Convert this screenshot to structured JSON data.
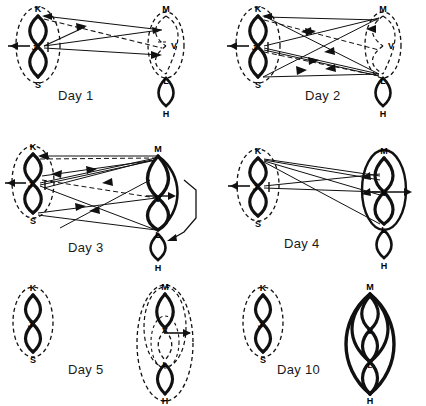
{
  "figure": {
    "type": "multi-panel network diagram",
    "panel_count": 6,
    "background": "#ffffff",
    "ink_color": "#111111"
  },
  "node_labels": {
    "K": "K",
    "J": "J",
    "S": "S",
    "M": "M",
    "V": "V",
    "L": "L",
    "H": "H"
  },
  "panels": [
    {
      "id": "day1",
      "label": "Day 1",
      "left_cluster": {
        "nodes": [
          "K",
          "J",
          "S"
        ],
        "outline": "dashed",
        "internal_links": "solid-bold"
      },
      "right_cluster": {
        "nodes": [
          "M",
          "V",
          "L"
        ],
        "outline": "dashed",
        "internal_links": "dashed"
      },
      "extra_group": {
        "nodes": [
          "L",
          "H"
        ],
        "outline": "none",
        "internal_links": "solid"
      },
      "input_arrow": true,
      "output_arrow": false,
      "inter_cluster_edges": 4,
      "dashed_edges": 1
    },
    {
      "id": "day2",
      "label": "Day 2",
      "left_cluster": {
        "nodes": [
          "K",
          "J",
          "S"
        ],
        "outline": "dashed",
        "internal_links": "solid-bold"
      },
      "right_cluster": {
        "nodes": [
          "M",
          "V",
          "L"
        ],
        "outline": "dashed",
        "internal_links": "dashed"
      },
      "extra_group": {
        "nodes": [
          "L",
          "H"
        ],
        "outline": "none",
        "internal_links": "solid"
      },
      "input_arrow": true,
      "output_arrow": false,
      "inter_cluster_edges": 9,
      "dashed_edges": 2
    },
    {
      "id": "day3",
      "label": "Day 3",
      "left_cluster": {
        "nodes": [
          "K",
          "J",
          "S"
        ],
        "outline": "dashed",
        "internal_links": "solid-bold"
      },
      "right_cluster": {
        "nodes": [
          "M",
          "V",
          "L"
        ],
        "outline": "none",
        "internal_links": "solid-bold"
      },
      "extra_group": {
        "nodes": [
          "L",
          "H"
        ],
        "outline": "none",
        "internal_links": "solid"
      },
      "bracket_M_to_H": true,
      "input_arrow": true,
      "output_arrow": true,
      "inter_cluster_edges": 10,
      "dashed_edges": 2
    },
    {
      "id": "day4",
      "label": "Day 4",
      "left_cluster": {
        "nodes": [
          "K",
          "J",
          "S"
        ],
        "outline": "dashed",
        "internal_links": "solid-bold"
      },
      "right_cluster": {
        "nodes": [
          "M",
          "V",
          "L"
        ],
        "outline": "solid-bold",
        "internal_links": "solid-bold"
      },
      "extra_group": {
        "nodes": [
          "L",
          "H"
        ],
        "outline": "none",
        "internal_links": "solid"
      },
      "input_arrow": true,
      "output_arrow": true,
      "inter_cluster_edges": 6,
      "dashed_edges": 0
    },
    {
      "id": "day5",
      "label": "Day 5",
      "left_cluster": {
        "nodes": [
          "K",
          "J",
          "S"
        ],
        "outline": "dashed",
        "internal_links": "solid-bold"
      },
      "right_cluster": {
        "nodes": [
          "M",
          "V",
          "L",
          "H"
        ],
        "outline": "dashed-nested",
        "internal_links": "mixed"
      },
      "input_arrow": false,
      "output_arrow": true,
      "inter_cluster_edges": 0,
      "dashed_edges": 0
    },
    {
      "id": "day10",
      "label": "Day 10",
      "left_cluster": {
        "nodes": [
          "K",
          "J",
          "S"
        ],
        "outline": "dashed",
        "internal_links": "solid-bold"
      },
      "right_cluster": {
        "nodes": [
          "M",
          "V",
          "L",
          "H"
        ],
        "outline": "none",
        "internal_links": "solid-bold-all"
      },
      "input_arrow": false,
      "output_arrow": false,
      "inter_cluster_edges": 0,
      "dashed_edges": 0
    }
  ]
}
